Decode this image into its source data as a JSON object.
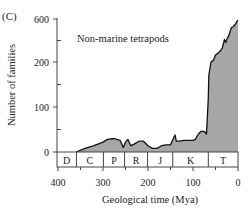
{
  "panel_label": "(C)",
  "chart_data": {
    "type": "area",
    "title": "Non-marine tetrapods",
    "xlabel": "Geological time (Mya)",
    "ylabel": "Number of families",
    "xlim": [
      400,
      0
    ],
    "x_ticks": [
      400,
      300,
      200,
      100,
      0
    ],
    "y_ticks": [
      0,
      100,
      200,
      600
    ],
    "y_scale_note": "non-linear axis: 0-200 linear, 200-600 compressed",
    "grid": false,
    "periods": [
      {
        "label": "D",
        "start": 400,
        "end": 359
      },
      {
        "label": "C",
        "start": 359,
        "end": 299
      },
      {
        "label": "P",
        "start": 299,
        "end": 252
      },
      {
        "label": "R",
        "start": 252,
        "end": 201
      },
      {
        "label": "J",
        "start": 201,
        "end": 145
      },
      {
        "label": "K",
        "start": 145,
        "end": 66
      },
      {
        "label": "T",
        "start": 66,
        "end": 0
      }
    ],
    "series": [
      {
        "name": "Non-marine tetrapods",
        "x": [
          360,
          340,
          320,
          300,
          290,
          275,
          262,
          255,
          250,
          245,
          238,
          230,
          220,
          210,
          200,
          190,
          180,
          170,
          160,
          150,
          140,
          137,
          130,
          120,
          110,
          100,
          95,
          88,
          82,
          75,
          70,
          66,
          65,
          60,
          55,
          50,
          45,
          40,
          35,
          30,
          27,
          24,
          20,
          15,
          10,
          5,
          2,
          0
        ],
        "values": [
          0,
          8,
          14,
          22,
          28,
          30,
          26,
          10,
          22,
          28,
          14,
          18,
          24,
          24,
          14,
          8,
          8,
          14,
          16,
          16,
          38,
          24,
          24,
          26,
          26,
          26,
          28,
          40,
          46,
          46,
          40,
          120,
          170,
          200,
          215,
          265,
          280,
          300,
          330,
          410,
          380,
          420,
          450,
          520,
          530,
          560,
          580,
          590
        ]
      }
    ]
  },
  "colors": {
    "fill": "#a6a6a6",
    "line": "#111111",
    "axis": "#444444",
    "text": "#222222"
  }
}
